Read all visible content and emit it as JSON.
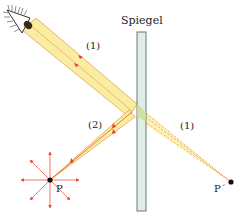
{
  "diagram": {
    "title": "Spiegel",
    "labels": {
      "beam1_upper": "(1)",
      "beam1_lower": "(1)",
      "beam2": "(2)",
      "point_object": "P",
      "point_image": "P´"
    },
    "colors": {
      "beam_fill": "#f9eda0",
      "beam_edge": "#e8a05a",
      "ray_arrow": "#e8402a",
      "mirror_fill": "#dfeee4",
      "mirror_edge": "#6e7a72",
      "point": "#111111",
      "virtual_ray": "#e08070"
    },
    "elements": {
      "eye": "eye-icon",
      "mirror": "mirror",
      "object_point": "P",
      "image_point": "P´"
    }
  }
}
